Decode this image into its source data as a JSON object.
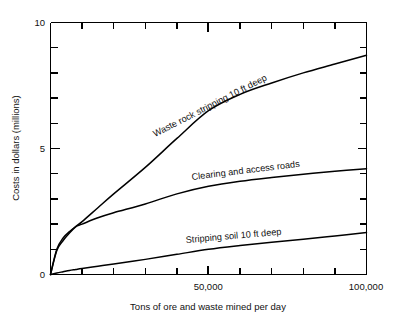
{
  "chart_data": {
    "type": "line",
    "title": "",
    "xlabel": "Tons of ore and waste mined per day",
    "ylabel": "Costs in dollars (millions)",
    "xlim": [
      0,
      100000
    ],
    "ylim": [
      0,
      10
    ],
    "grid": false,
    "legend_position": "inline-curve-labels",
    "x_tick_labels": [
      "50,000",
      "100,000"
    ],
    "x_tick_values": [
      50000,
      100000
    ],
    "x_minor_tick_values": [
      10000,
      20000,
      30000,
      40000,
      60000,
      70000,
      80000,
      90000
    ],
    "y_tick_labels": [
      "0",
      "5",
      "10"
    ],
    "y_tick_values": [
      0,
      5,
      10
    ],
    "y_minor_tick_values": [
      1,
      2,
      3,
      4,
      6,
      7,
      8,
      9
    ],
    "x": [
      0,
      2000,
      4000,
      6000,
      8000,
      10000,
      15000,
      20000,
      30000,
      40000,
      50000,
      60000,
      70000,
      80000,
      90000,
      100000
    ],
    "series": [
      {
        "name": "Waste rock stripping 10 ft deep",
        "label": "Waste rock stripping 10 ft deep",
        "values": [
          0,
          0.95,
          1.35,
          1.65,
          1.9,
          2.1,
          2.65,
          3.2,
          4.25,
          5.4,
          6.5,
          7.15,
          7.6,
          8.0,
          8.35,
          8.7
        ]
      },
      {
        "name": "Clearing and access roads",
        "label": "Clearing and access roads",
        "values": [
          0,
          1.0,
          1.45,
          1.7,
          1.9,
          2.0,
          2.25,
          2.45,
          2.8,
          3.2,
          3.5,
          3.7,
          3.85,
          3.98,
          4.1,
          4.2
        ]
      },
      {
        "name": "Stripping soil 10 ft deep",
        "label": "Stripping soil 10 ft deep",
        "values": [
          0,
          0.06,
          0.11,
          0.16,
          0.2,
          0.24,
          0.33,
          0.42,
          0.6,
          0.8,
          1.0,
          1.15,
          1.28,
          1.4,
          1.53,
          1.67
        ]
      }
    ]
  },
  "axes": {
    "y_title": "Costs in dollars (millions)",
    "x_title": "Tons of ore and waste mined per day",
    "y_labels": {
      "top": "10",
      "mid": "5",
      "bottom": "0"
    },
    "x_labels": {
      "mid": "50,000",
      "right": "100,000"
    }
  },
  "curve_labels": {
    "waste_rock": "Waste rock stripping 10 ft deep",
    "clearing": "Clearing and access roads",
    "stripping_soil": "Stripping soil 10 ft deep"
  },
  "colors": {
    "line": "#000000",
    "text": "#111111",
    "background": "#ffffff"
  }
}
